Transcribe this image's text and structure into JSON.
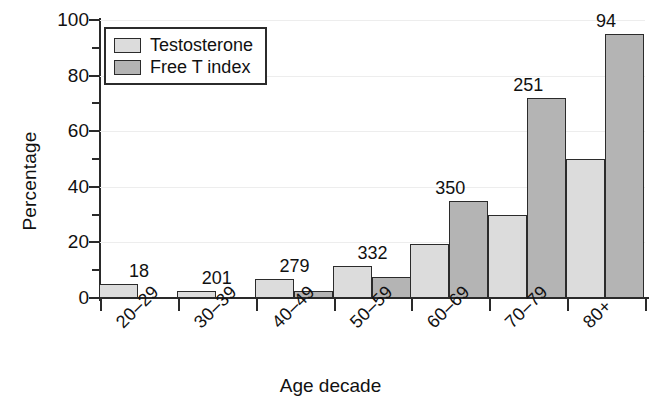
{
  "chart_data": {
    "type": "bar",
    "title": "",
    "xlabel": "Age decade",
    "ylabel": "Percentage",
    "categories": [
      "20–29",
      "30–39",
      "40–49",
      "50–59",
      "60–69",
      "70–79",
      "80+"
    ],
    "group_counts": [
      "18",
      "201",
      "279",
      "332",
      "350",
      "251",
      "94"
    ],
    "series": [
      {
        "name": "Testosterone",
        "color": "#dcdcdc",
        "values": [
          5,
          2.5,
          7,
          11.5,
          19.5,
          30,
          50
        ]
      },
      {
        "name": "Free T index",
        "color": "#b4b4b4",
        "values": [
          0,
          0,
          2.5,
          7.5,
          35,
          72,
          95
        ]
      }
    ],
    "ylim": [
      0,
      100
    ],
    "ytick_labels": [
      "0",
      "20",
      "40",
      "60",
      "80",
      "100"
    ],
    "ytick_values": [
      0,
      20,
      40,
      60,
      80,
      100
    ],
    "yminor_values": [
      10,
      30,
      50,
      70,
      90
    ],
    "grid": "horizontal",
    "legend_position": "top-left",
    "axis_color": "#2b2b2b",
    "grid_color": "#ededed"
  },
  "legend": {
    "entries": [
      {
        "label": "Testosterone"
      },
      {
        "label": "Free T index"
      }
    ]
  }
}
